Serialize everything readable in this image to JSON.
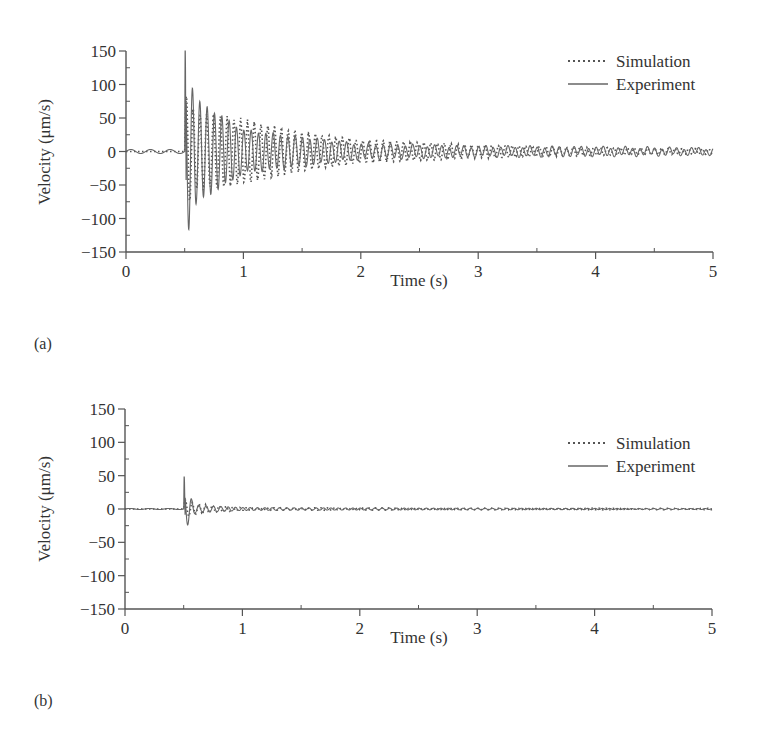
{
  "figure": {
    "panels": [
      {
        "label": "(a)",
        "xlabel": "Time (s)",
        "ylabel": "Velocity (μm/s)",
        "legend": {
          "simulation": "Simulation",
          "experiment": "Experiment"
        }
      },
      {
        "label": "(b)",
        "xlabel": "Time (s)",
        "ylabel": "Velocity (μm/s)",
        "legend": {
          "simulation": "Simulation",
          "experiment": "Experiment"
        }
      }
    ],
    "colors": {
      "axis": "#555555",
      "simulation": "#555555",
      "experiment": "#666666"
    }
  },
  "chart_data": [
    {
      "type": "line",
      "title": "",
      "panel": "(a)",
      "xlabel": "Time (s)",
      "ylabel": "Velocity (μm/s)",
      "xlim": [
        0,
        5
      ],
      "ylim": [
        -150,
        150
      ],
      "xticks": [
        0,
        1,
        2,
        3,
        4,
        5
      ],
      "yticks": [
        150,
        100,
        50,
        0,
        -50,
        -100,
        -150
      ],
      "grid": false,
      "legend_position": "upper right",
      "series": [
        {
          "name": "Simulation",
          "style": "dotted",
          "description": "Impulse at t=0.5 s, decaying oscillation",
          "envelope": {
            "t": [
              0.5,
              0.6,
              0.8,
              1.0,
              1.5,
              2.0,
              3.0,
              4.0,
              5.0
            ],
            "amplitude": [
              90,
              60,
              55,
              50,
              30,
              18,
              10,
              6,
              4
            ]
          }
        },
        {
          "name": "Experiment",
          "style": "solid",
          "description": "Small baseline ripple before 0.5 s, spike to ~150 at 0.5 s, min ~-90, decaying oscillation",
          "peak": {
            "t": 0.5,
            "value": 150
          },
          "min": {
            "t": 0.57,
            "value": -90
          },
          "envelope": {
            "t": [
              0,
              0.5,
              0.6,
              1.0,
              2.0,
              3.0,
              4.0,
              5.0
            ],
            "amplitude": [
              3,
              150,
              85,
              35,
              12,
              8,
              7,
              5
            ]
          }
        }
      ]
    },
    {
      "type": "line",
      "title": "",
      "panel": "(b)",
      "xlabel": "Time (s)",
      "ylabel": "Velocity (μm/s)",
      "xlim": [
        0,
        5
      ],
      "ylim": [
        -150,
        150
      ],
      "xticks": [
        0,
        1,
        2,
        3,
        4,
        5
      ],
      "yticks": [
        150,
        100,
        50,
        0,
        -50,
        -100,
        -150
      ],
      "grid": false,
      "legend_position": "upper right",
      "series": [
        {
          "name": "Simulation",
          "style": "dotted",
          "description": "Near zero, small transient at 0.5 s",
          "envelope": {
            "t": [
              0.5,
              0.6,
              1.0,
              5.0
            ],
            "amplitude": [
              15,
              8,
              2,
              1
            ]
          }
        },
        {
          "name": "Experiment",
          "style": "solid",
          "description": "Spike to ~48 at 0.5 s, dip ~-20, quickly damped",
          "peak": {
            "t": 0.5,
            "value": 48
          },
          "min": {
            "t": 0.51,
            "value": -20
          },
          "envelope": {
            "t": [
              0.5,
              0.6,
              1.0,
              2.0,
              5.0
            ],
            "amplitude": [
              48,
              8,
              3,
              2,
              1
            ]
          }
        }
      ]
    }
  ]
}
